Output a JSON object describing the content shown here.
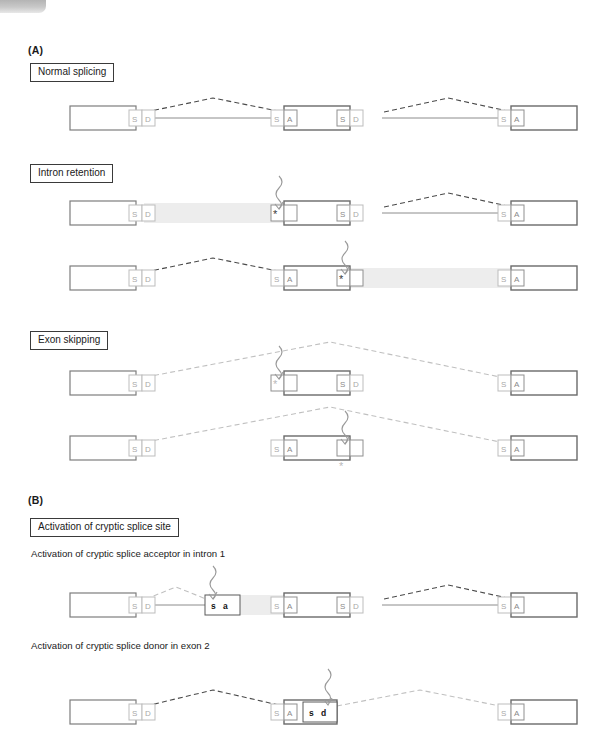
{
  "figure": {
    "panels": [
      {
        "letter": "(A)"
      },
      {
        "letter": "(B)"
      }
    ],
    "titles": {
      "normal_splicing": "Normal splicing",
      "intron_retention": "Intron retention",
      "exon_skipping": "Exon skipping",
      "cryptic_splice_site": "Activation of cryptic splice site"
    },
    "subtitles": {
      "cryptic_acceptor": "Activation of cryptic splice acceptor in intron 1",
      "cryptic_donor": "Activation of cryptic splice donor in exon 2"
    },
    "labels": {
      "splice_donor_s": "S",
      "splice_donor_d": "D",
      "splice_acceptor_s": "S",
      "splice_acceptor_a": "A",
      "cryptic_acceptor_s": "s",
      "cryptic_acceptor_a": "a",
      "cryptic_donor_s": "s",
      "cryptic_donor_d": "d",
      "mutation_marker": "*"
    },
    "caption": ""
  },
  "colors": {
    "exon_border": "#7d7d7d",
    "intron_line": "#8c8c8c",
    "retained_intron_fill": "#ededed",
    "arc_active": "#4a4a4a",
    "arc_inactive": "#c0c0c0",
    "site_label": "#a8a8a8",
    "mutation_star": "#3a3a3a",
    "page_background": "#ffffff"
  }
}
